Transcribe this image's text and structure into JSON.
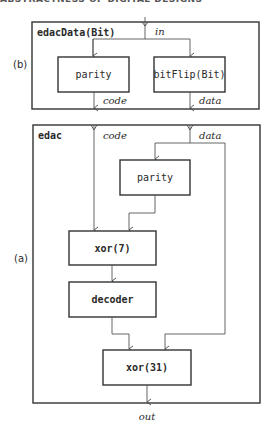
{
  "running_header": "ABSTRACTNESS OF DIGITAL DESIGNS",
  "diagram_b": {
    "panel_label": "(b)",
    "title": "edacData(Bit)",
    "input_label": "in",
    "blocks": [
      {
        "id": "parity",
        "label": "parity"
      },
      {
        "id": "bitflip",
        "label": "bitFlip(Bit)"
      }
    ],
    "outputs": [
      {
        "label": "code"
      },
      {
        "label": "data"
      }
    ]
  },
  "diagram_a": {
    "panel_label": "(a)",
    "title": "edac",
    "inputs": [
      {
        "label": "code"
      },
      {
        "label": "data"
      }
    ],
    "blocks": [
      {
        "id": "parity",
        "label": "parity"
      },
      {
        "id": "xor7",
        "label": "xor(7)"
      },
      {
        "id": "decoder",
        "label": "decoder"
      },
      {
        "id": "xor31",
        "label": "xor(31)"
      }
    ],
    "output_label": "out"
  }
}
